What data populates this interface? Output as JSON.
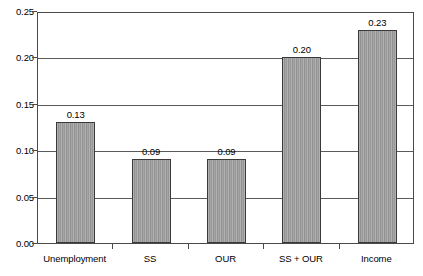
{
  "chart_data": {
    "type": "bar",
    "title": "",
    "subtitle": "",
    "xlabel": "",
    "ylabel": "",
    "categories": [
      "Unemployment",
      "SS",
      "OUR",
      "SS + OUR",
      "Income"
    ],
    "values": [
      0.13,
      0.09,
      0.09,
      0.2,
      0.23
    ],
    "data_labels": [
      "0.13",
      "0.09",
      "0.09",
      "0.20",
      "0.23"
    ],
    "ylim": [
      0.0,
      0.25
    ],
    "ytick_values": [
      0.25,
      0.2,
      0.15,
      0.1,
      0.05,
      0.0
    ],
    "ytick_labels": [
      "0.25",
      "0.20",
      "0.15",
      "0.10",
      "0.05",
      "0.00"
    ],
    "grid": true,
    "grid_axis": "y",
    "legend": false,
    "legend_position": "none",
    "bar_fill_color": "#9b9b9b",
    "bar_border_color": "#3a3a3a",
    "plot_background_color": "#ffffff",
    "axis_color": "#4a4a4a",
    "gridline_color": "#5a5a5a"
  }
}
